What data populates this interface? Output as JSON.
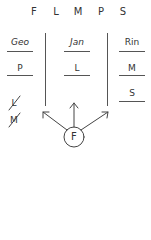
{
  "header": {
    "letters": [
      "F",
      "L",
      "M",
      "P",
      "S"
    ]
  },
  "columns": [
    {
      "name": "Geo",
      "entries": [
        "P"
      ]
    },
    {
      "name": "Jan",
      "entries": [
        "L"
      ]
    },
    {
      "name": "Rin",
      "entries": [
        "M",
        "S"
      ]
    }
  ],
  "eliminated": [
    "L",
    "M"
  ],
  "node": {
    "label": "F",
    "arrows": [
      "left",
      "up",
      "right"
    ]
  },
  "colors": {
    "ink": "#333333",
    "line": "#555555",
    "background": "#ffffff"
  }
}
